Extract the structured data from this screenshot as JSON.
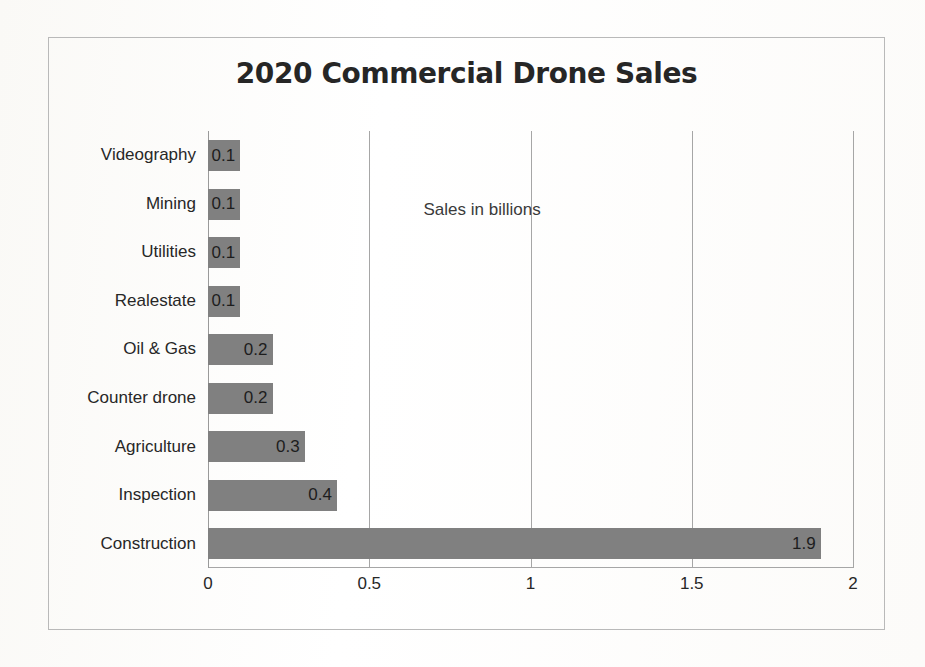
{
  "chart_data": {
    "type": "bar",
    "orientation": "horizontal",
    "title": "2020 Commercial Drone Sales",
    "annotation": "Sales in billions",
    "xlabel": "",
    "ylabel": "",
    "xlim": [
      0,
      2
    ],
    "xticks": [
      "0",
      "0.5",
      "1",
      "1.5",
      "2"
    ],
    "xtick_values": [
      0,
      0.5,
      1,
      1.5,
      2
    ],
    "grid": "vertical",
    "legend": "none",
    "bar_color": "#808080",
    "categories": [
      "Videography",
      "Mining",
      "Utilities",
      "Realestate",
      "Oil & Gas",
      "Counter drone",
      "Agriculture",
      "Inspection",
      "Construction"
    ],
    "values": [
      0.1,
      0.1,
      0.1,
      0.1,
      0.2,
      0.2,
      0.3,
      0.4,
      1.9
    ],
    "value_labels": [
      "0.1",
      "0.1",
      "0.1",
      "0.1",
      "0.2",
      "0.2",
      "0.3",
      "0.4",
      "1.9"
    ]
  }
}
